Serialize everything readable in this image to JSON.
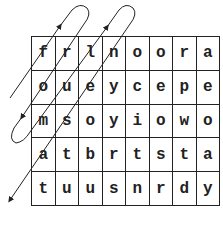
{
  "puzzle": {
    "type": "word-search-grid",
    "rows": 5,
    "cols": 8,
    "grid": [
      [
        "f",
        "r",
        "l",
        "n",
        "o",
        "o",
        "r",
        "a"
      ],
      [
        "o",
        "u",
        "e",
        "y",
        "c",
        "e",
        "p",
        "e"
      ],
      [
        "m",
        "s",
        "o",
        "y",
        "i",
        "o",
        "w",
        "o"
      ],
      [
        "a",
        "t",
        "b",
        "r",
        "t",
        "s",
        "t",
        "a"
      ],
      [
        "t",
        "u",
        "u",
        "s",
        "n",
        "r",
        "d",
        "y"
      ]
    ],
    "path": {
      "description": "zigzag diagonal reading path with looped turns and arrowheads, ending at bottom-left",
      "color": "#222222"
    }
  }
}
